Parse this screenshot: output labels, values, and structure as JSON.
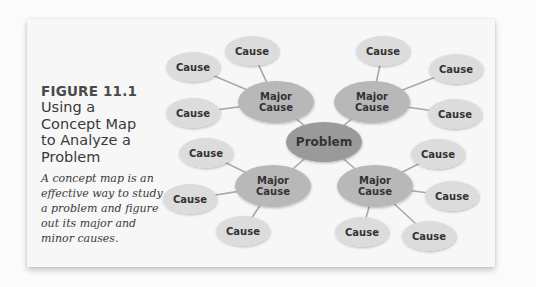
{
  "figure": {
    "number": "FIGURE 11.1",
    "title_lines": [
      "Using a",
      "Concept Map",
      "to Analyze a",
      "Problem"
    ],
    "description": "A concept map is an effective way to study a problem and figure out its major and minor causes."
  },
  "colors": {
    "background": "#fbfbfb",
    "card": "#f7f7f7",
    "problem_fill": "#9a9a9a",
    "major_fill": "#b8b8b8",
    "minor_fill": "#dcdcdc",
    "connector": "#a8a8a8"
  },
  "concept_map": {
    "center": {
      "label": "Problem",
      "x": 324,
      "y": 142
    },
    "clusters": [
      {
        "major": {
          "label_lines": [
            "Major",
            "Cause"
          ],
          "x": 276,
          "y": 102
        },
        "minors": [
          {
            "label": "Cause",
            "x": 193,
            "y": 67
          },
          {
            "label": "Cause",
            "x": 252,
            "y": 51
          },
          {
            "label": "Cause",
            "x": 193,
            "y": 113
          }
        ]
      },
      {
        "major": {
          "label_lines": [
            "Major",
            "Cause"
          ],
          "x": 372,
          "y": 102
        },
        "minors": [
          {
            "label": "Cause",
            "x": 383,
            "y": 51
          },
          {
            "label": "Cause",
            "x": 456,
            "y": 69
          },
          {
            "label": "Cause",
            "x": 455,
            "y": 114
          }
        ]
      },
      {
        "major": {
          "label_lines": [
            "Major",
            "Cause"
          ],
          "x": 273,
          "y": 186
        },
        "minors": [
          {
            "label": "Cause",
            "x": 206,
            "y": 153
          },
          {
            "label": "Cause",
            "x": 190,
            "y": 199
          },
          {
            "label": "Cause",
            "x": 243,
            "y": 231
          }
        ]
      },
      {
        "major": {
          "label_lines": [
            "Major",
            "Cause"
          ],
          "x": 375,
          "y": 186
        },
        "minors": [
          {
            "label": "Cause",
            "x": 438,
            "y": 154
          },
          {
            "label": "Cause",
            "x": 452,
            "y": 196
          },
          {
            "label": "Cause",
            "x": 362,
            "y": 232
          },
          {
            "label": "Cause",
            "x": 429,
            "y": 236
          }
        ]
      }
    ]
  }
}
